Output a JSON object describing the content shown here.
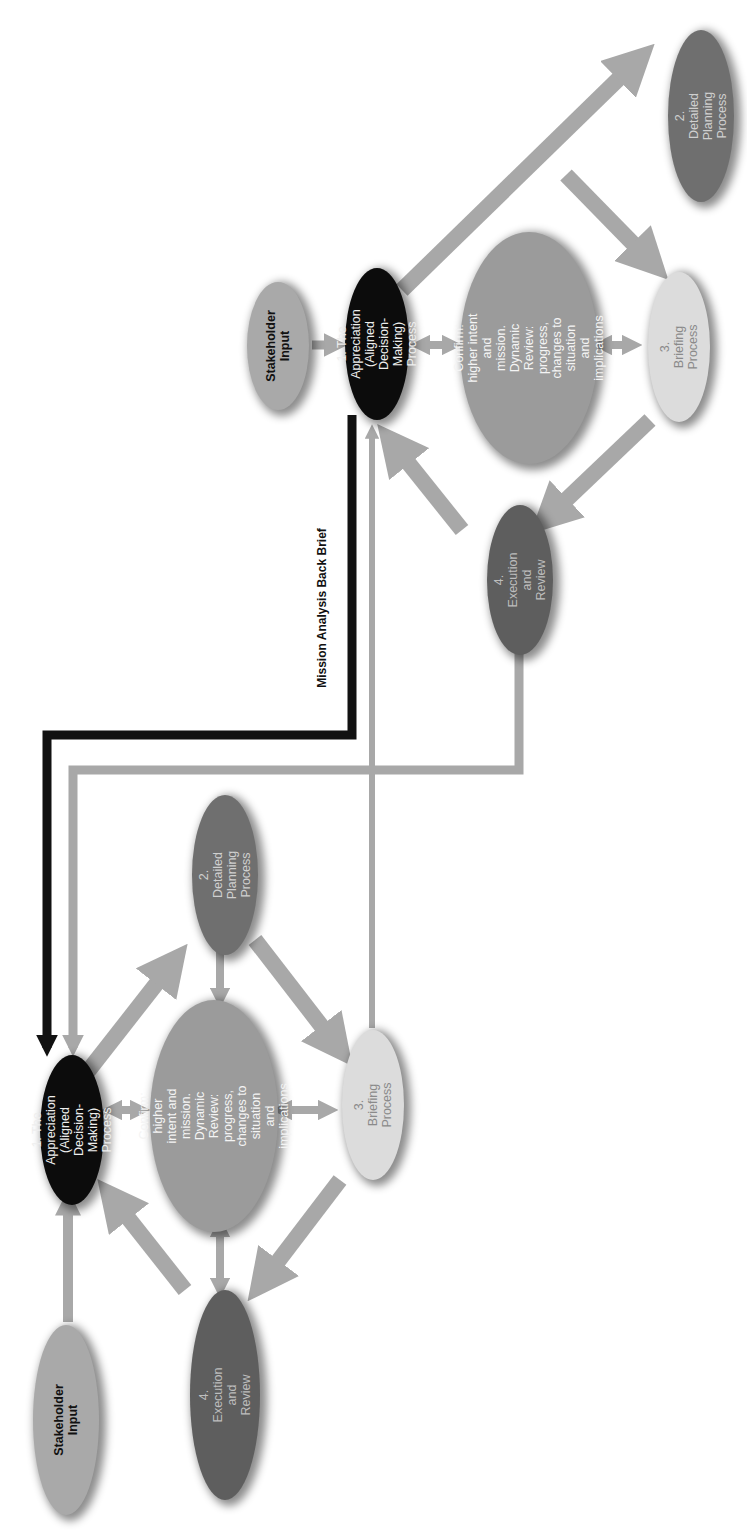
{
  "diagram": {
    "orientation": "rotated 90 degrees counter-clockwise",
    "colors": {
      "arrow": "#a8a8a8",
      "back_brief_line": "#111111",
      "stakeholder": "#a9a9a9",
      "appreciation": "#0c0c0c",
      "confirm": "#9b9b9b",
      "planning": "#6f6f6f",
      "briefing": "#dcdcdc",
      "execution": "#5e5e5e"
    },
    "connector_label": "Mission Analysis Back Brief",
    "clusters": [
      {
        "name": "higher-level cycle",
        "nodes": {
          "stakeholder": "Stakeholder\nInput",
          "appreciation": "1. The Appreciation\n(Aligned Decision-\nMaking) Process",
          "confirm": "Confirm:\nhigher intent and mission.\nDynamic Review:\nprogress, changes to situation\nand implications",
          "planning": "2. Detailed\nPlanning Process",
          "briefing": "3. Briefing Process",
          "execution": "4. Execution\nand Review"
        }
      },
      {
        "name": "lower-level cycle",
        "nodes": {
          "stakeholder": "Stakeholder\nInput",
          "appreciation": "1. The Appreciation\n(Aligned Decision-\nMaking) Process",
          "confirm": "Confirm:\nhigher intent and mission.\nDynamic Review:\nprogress, changes to situation\nand implications",
          "planning": "2. Detailed\nPlanning Process",
          "briefing": "3. Briefing Process",
          "execution": "4. Execution\nand Review"
        }
      }
    ],
    "edges": [
      "Stakeholder Input -> 1. The Appreciation",
      "1. The Appreciation -> 2. Detailed Planning Process",
      "2. Detailed Planning Process -> 3. Briefing Process",
      "3. Briefing Process -> 4. Execution and Review",
      "4. Execution and Review -> 1. The Appreciation",
      "Confirm <-> 1. The Appreciation",
      "Confirm <-> 2. Detailed Planning Process",
      "Confirm <-> 3. Briefing Process",
      "Confirm <-> 4. Execution and Review",
      "Higher 1. The Appreciation -> Lower 1. The Appreciation (Mission Analysis Back Brief)",
      "Higher 4. Execution and Review -> Lower 1. The Appreciation",
      "Lower 3. Briefing Process -> Higher 1. The Appreciation"
    ]
  }
}
